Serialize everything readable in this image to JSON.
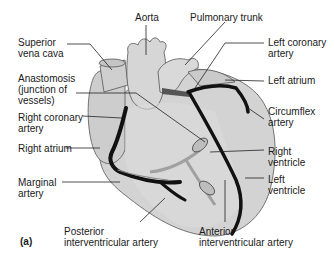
{
  "figure": {
    "panel_label": "(a)"
  },
  "labels": {
    "aorta": [
      "Aorta"
    ],
    "pulmonary_trunk": [
      "Pulmonary trunk"
    ],
    "superior_vena_cava": [
      "Superior",
      "vena cava"
    ],
    "left_coronary_artery": [
      "Left coronary",
      "artery"
    ],
    "left_atrium": [
      "Left atrium"
    ],
    "anastomosis": [
      "Anastomosis",
      "(junction of",
      "vessels)"
    ],
    "circumflex_artery": [
      "Circumflex",
      "artery"
    ],
    "right_coronary_artery": [
      "Right coronary",
      "artery"
    ],
    "right_atrium": [
      "Right atrium"
    ],
    "right_ventricle": [
      "Right",
      "ventricle"
    ],
    "left_ventricle": [
      "Left",
      "ventricle"
    ],
    "marginal_artery": [
      "Marginal",
      "artery"
    ],
    "posterior_interventricular_artery": [
      "Posterior",
      "interventricular artery"
    ],
    "anterior_interventricular_artery": [
      "Anterior",
      "interventricular artery"
    ]
  },
  "colors": {
    "heart_fill": "#cfcfcf",
    "heart_light": "#dcdcdc",
    "outline": "#555555",
    "artery": "#111111",
    "vein_fill": "#b9b9b9",
    "leader": "#222222",
    "text": "#1a1a1a"
  }
}
